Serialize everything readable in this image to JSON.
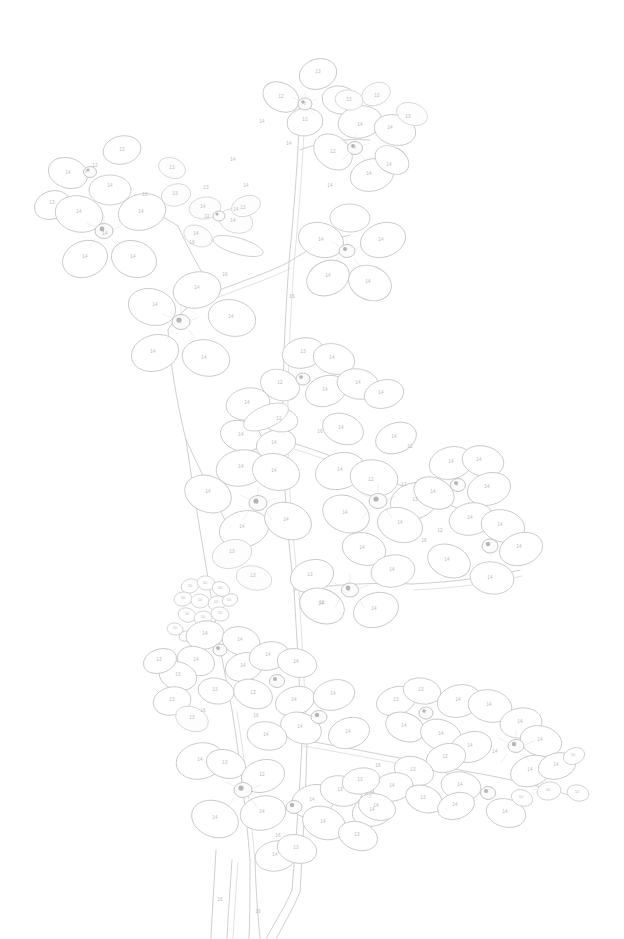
{
  "page": {
    "kind": "paint-by-numbers-coloring-page",
    "width": 624,
    "height": 939,
    "background_color": "#ffffff",
    "line_color": "#c9c9c9",
    "number_color": "#b9b9b9"
  },
  "palette_keys": {
    "petal": "14",
    "petal_alt": "13",
    "petal_shadow": "12",
    "bud": "10",
    "center": "2",
    "stem": "16"
  },
  "legend": [
    {
      "number": "2",
      "meaning": "flower center"
    },
    {
      "number": "10",
      "meaning": "small bud"
    },
    {
      "number": "12",
      "meaning": "shadowed petal"
    },
    {
      "number": "13",
      "meaning": "mid petal"
    },
    {
      "number": "14",
      "meaning": "light petal"
    },
    {
      "number": "16",
      "meaning": "stem"
    }
  ],
  "regions": [
    {
      "n": "13",
      "x": 318,
      "y": 72
    },
    {
      "n": "12",
      "x": 281,
      "y": 97
    },
    {
      "n": "13",
      "x": 305,
      "y": 120
    },
    {
      "n": "13",
      "x": 349,
      "y": 100
    },
    {
      "n": "12",
      "x": 377,
      "y": 96
    },
    {
      "n": "2",
      "x": 305,
      "y": 104
    },
    {
      "n": "14",
      "x": 262,
      "y": 122
    },
    {
      "n": "14",
      "x": 289,
      "y": 144
    },
    {
      "n": "14",
      "x": 233,
      "y": 160
    },
    {
      "n": "14",
      "x": 360,
      "y": 125
    },
    {
      "n": "14",
      "x": 390,
      "y": 128
    },
    {
      "n": "13",
      "x": 408,
      "y": 117
    },
    {
      "n": "12",
      "x": 333,
      "y": 152
    },
    {
      "n": "14",
      "x": 369,
      "y": 174
    },
    {
      "n": "14",
      "x": 389,
      "y": 165
    },
    {
      "n": "2",
      "x": 355,
      "y": 148
    },
    {
      "n": "14",
      "x": 330,
      "y": 186
    },
    {
      "n": "14",
      "x": 246,
      "y": 186
    },
    {
      "n": "13",
      "x": 206,
      "y": 188
    },
    {
      "n": "14",
      "x": 236,
      "y": 210
    },
    {
      "n": "13",
      "x": 122,
      "y": 150
    },
    {
      "n": "14",
      "x": 68,
      "y": 173
    },
    {
      "n": "13",
      "x": 52,
      "y": 203
    },
    {
      "n": "14",
      "x": 110,
      "y": 186
    },
    {
      "n": "12",
      "x": 95,
      "y": 166
    },
    {
      "n": "2",
      "x": 86,
      "y": 172
    },
    {
      "n": "13",
      "x": 172,
      "y": 168
    },
    {
      "n": "13",
      "x": 175,
      "y": 194
    },
    {
      "n": "14",
      "x": 79,
      "y": 212
    },
    {
      "n": "14",
      "x": 105,
      "y": 234
    },
    {
      "n": "14",
      "x": 141,
      "y": 212
    },
    {
      "n": "2",
      "x": 103,
      "y": 230
    },
    {
      "n": "14",
      "x": 85,
      "y": 257
    },
    {
      "n": "14",
      "x": 133,
      "y": 257
    },
    {
      "n": "13",
      "x": 145,
      "y": 195
    },
    {
      "n": "14",
      "x": 203,
      "y": 207
    },
    {
      "n": "12",
      "x": 207,
      "y": 217
    },
    {
      "n": "14",
      "x": 233,
      "y": 221
    },
    {
      "n": "13",
      "x": 243,
      "y": 208
    },
    {
      "n": "14",
      "x": 196,
      "y": 234
    },
    {
      "n": "16",
      "x": 192,
      "y": 243
    },
    {
      "n": "14",
      "x": 197,
      "y": 288
    },
    {
      "n": "14",
      "x": 155,
      "y": 305
    },
    {
      "n": "14",
      "x": 231,
      "y": 317
    },
    {
      "n": "2",
      "x": 180,
      "y": 322
    },
    {
      "n": "14",
      "x": 153,
      "y": 352
    },
    {
      "n": "14",
      "x": 204,
      "y": 358
    },
    {
      "n": "16",
      "x": 225,
      "y": 275
    },
    {
      "n": "16",
      "x": 292,
      "y": 297
    },
    {
      "n": "14",
      "x": 321,
      "y": 240
    },
    {
      "n": "14",
      "x": 381,
      "y": 240
    },
    {
      "n": "2",
      "x": 346,
      "y": 250
    },
    {
      "n": "14",
      "x": 328,
      "y": 276
    },
    {
      "n": "14",
      "x": 368,
      "y": 282
    },
    {
      "n": "13",
      "x": 303,
      "y": 352
    },
    {
      "n": "14",
      "x": 332,
      "y": 358
    },
    {
      "n": "12",
      "x": 280,
      "y": 383
    },
    {
      "n": "14",
      "x": 247,
      "y": 403
    },
    {
      "n": "14",
      "x": 325,
      "y": 390
    },
    {
      "n": "2",
      "x": 302,
      "y": 378
    },
    {
      "n": "14",
      "x": 358,
      "y": 383
    },
    {
      "n": "14",
      "x": 381,
      "y": 393
    },
    {
      "n": "12",
      "x": 279,
      "y": 419
    },
    {
      "n": "14",
      "x": 241,
      "y": 435
    },
    {
      "n": "14",
      "x": 274,
      "y": 443
    },
    {
      "n": "16",
      "x": 320,
      "y": 432
    },
    {
      "n": "14",
      "x": 341,
      "y": 428
    },
    {
      "n": "14",
      "x": 394,
      "y": 437
    },
    {
      "n": "12",
      "x": 410,
      "y": 447
    },
    {
      "n": "14",
      "x": 451,
      "y": 462
    },
    {
      "n": "14",
      "x": 479,
      "y": 460
    },
    {
      "n": "2",
      "x": 457,
      "y": 485
    },
    {
      "n": "14",
      "x": 433,
      "y": 492
    },
    {
      "n": "13",
      "x": 404,
      "y": 485
    },
    {
      "n": "14",
      "x": 487,
      "y": 487
    },
    {
      "n": "14",
      "x": 241,
      "y": 467
    },
    {
      "n": "14",
      "x": 274,
      "y": 471
    },
    {
      "n": "14",
      "x": 208,
      "y": 492
    },
    {
      "n": "2",
      "x": 257,
      "y": 503
    },
    {
      "n": "14",
      "x": 242,
      "y": 527
    },
    {
      "n": "14",
      "x": 286,
      "y": 520
    },
    {
      "n": "13",
      "x": 232,
      "y": 552
    },
    {
      "n": "14",
      "x": 340,
      "y": 470
    },
    {
      "n": "12",
      "x": 371,
      "y": 480
    },
    {
      "n": "2",
      "x": 377,
      "y": 500
    },
    {
      "n": "14",
      "x": 345,
      "y": 513
    },
    {
      "n": "13",
      "x": 415,
      "y": 500
    },
    {
      "n": "14",
      "x": 400,
      "y": 523
    },
    {
      "n": "14",
      "x": 470,
      "y": 518
    },
    {
      "n": "12",
      "x": 440,
      "y": 531
    },
    {
      "n": "14",
      "x": 500,
      "y": 525
    },
    {
      "n": "2",
      "x": 489,
      "y": 545
    },
    {
      "n": "14",
      "x": 519,
      "y": 547
    },
    {
      "n": "14",
      "x": 447,
      "y": 560
    },
    {
      "n": "16",
      "x": 424,
      "y": 541
    },
    {
      "n": "14",
      "x": 362,
      "y": 548
    },
    {
      "n": "13",
      "x": 310,
      "y": 575
    },
    {
      "n": "14",
      "x": 392,
      "y": 570
    },
    {
      "n": "2",
      "x": 349,
      "y": 590
    },
    {
      "n": "14",
      "x": 321,
      "y": 604
    },
    {
      "n": "14",
      "x": 374,
      "y": 609
    },
    {
      "n": "13",
      "x": 253,
      "y": 576
    },
    {
      "n": "16",
      "x": 322,
      "y": 603
    },
    {
      "n": "14",
      "x": 490,
      "y": 578
    },
    {
      "n": "10",
      "x": 190,
      "y": 586
    },
    {
      "n": "10",
      "x": 205,
      "y": 583
    },
    {
      "n": "10",
      "x": 220,
      "y": 588
    },
    {
      "n": "10",
      "x": 183,
      "y": 598
    },
    {
      "n": "10",
      "x": 200,
      "y": 600
    },
    {
      "n": "10",
      "x": 216,
      "y": 602
    },
    {
      "n": "10",
      "x": 187,
      "y": 614
    },
    {
      "n": "10",
      "x": 203,
      "y": 617
    },
    {
      "n": "10",
      "x": 220,
      "y": 613
    },
    {
      "n": "10",
      "x": 229,
      "y": 600
    },
    {
      "n": "14",
      "x": 205,
      "y": 634
    },
    {
      "n": "10",
      "x": 175,
      "y": 628
    },
    {
      "n": "14",
      "x": 240,
      "y": 640
    },
    {
      "n": "2",
      "x": 219,
      "y": 649
    },
    {
      "n": "14",
      "x": 196,
      "y": 660
    },
    {
      "n": "14",
      "x": 243,
      "y": 666
    },
    {
      "n": "13",
      "x": 178,
      "y": 675
    },
    {
      "n": "13",
      "x": 159,
      "y": 660
    },
    {
      "n": "13",
      "x": 172,
      "y": 700
    },
    {
      "n": "13",
      "x": 215,
      "y": 690
    },
    {
      "n": "16",
      "x": 203,
      "y": 711
    },
    {
      "n": "13",
      "x": 192,
      "y": 718
    },
    {
      "n": "14",
      "x": 268,
      "y": 655
    },
    {
      "n": "14",
      "x": 296,
      "y": 662
    },
    {
      "n": "2",
      "x": 276,
      "y": 680
    },
    {
      "n": "13",
      "x": 253,
      "y": 693
    },
    {
      "n": "14",
      "x": 294,
      "y": 700
    },
    {
      "n": "16",
      "x": 256,
      "y": 716
    },
    {
      "n": "14",
      "x": 333,
      "y": 694
    },
    {
      "n": "2",
      "x": 318,
      "y": 716
    },
    {
      "n": "14",
      "x": 300,
      "y": 727
    },
    {
      "n": "14",
      "x": 348,
      "y": 732
    },
    {
      "n": "14",
      "x": 266,
      "y": 735
    },
    {
      "n": "14",
      "x": 200,
      "y": 760
    },
    {
      "n": "2",
      "x": 242,
      "y": 790
    },
    {
      "n": "13",
      "x": 225,
      "y": 763
    },
    {
      "n": "12",
      "x": 262,
      "y": 775
    },
    {
      "n": "14",
      "x": 215,
      "y": 818
    },
    {
      "n": "14",
      "x": 262,
      "y": 812
    },
    {
      "n": "16",
      "x": 278,
      "y": 836
    },
    {
      "n": "14",
      "x": 275,
      "y": 855
    },
    {
      "n": "13",
      "x": 296,
      "y": 848
    },
    {
      "n": "14",
      "x": 312,
      "y": 800
    },
    {
      "n": "2",
      "x": 293,
      "y": 806
    },
    {
      "n": "13",
      "x": 340,
      "y": 790
    },
    {
      "n": "14",
      "x": 323,
      "y": 822
    },
    {
      "n": "14",
      "x": 372,
      "y": 810
    },
    {
      "n": "2",
      "x": 370,
      "y": 797
    },
    {
      "n": "13",
      "x": 357,
      "y": 835
    },
    {
      "n": "16",
      "x": 220,
      "y": 900
    },
    {
      "n": "16",
      "x": 258,
      "y": 912
    },
    {
      "n": "13",
      "x": 396,
      "y": 700
    },
    {
      "n": "13",
      "x": 421,
      "y": 690
    },
    {
      "n": "2",
      "x": 425,
      "y": 712
    },
    {
      "n": "14",
      "x": 404,
      "y": 726
    },
    {
      "n": "14",
      "x": 458,
      "y": 700
    },
    {
      "n": "14",
      "x": 489,
      "y": 705
    },
    {
      "n": "14",
      "x": 441,
      "y": 734
    },
    {
      "n": "14",
      "x": 470,
      "y": 746
    },
    {
      "n": "2",
      "x": 515,
      "y": 745
    },
    {
      "n": "14",
      "x": 495,
      "y": 752
    },
    {
      "n": "14",
      "x": 540,
      "y": 740
    },
    {
      "n": "10",
      "x": 573,
      "y": 755
    },
    {
      "n": "14",
      "x": 530,
      "y": 770
    },
    {
      "n": "12",
      "x": 445,
      "y": 757
    },
    {
      "n": "13",
      "x": 413,
      "y": 770
    },
    {
      "n": "14",
      "x": 392,
      "y": 786
    },
    {
      "n": "14",
      "x": 460,
      "y": 785
    },
    {
      "n": "2",
      "x": 487,
      "y": 792
    },
    {
      "n": "13",
      "x": 423,
      "y": 798
    },
    {
      "n": "14",
      "x": 455,
      "y": 805
    },
    {
      "n": "10",
      "x": 521,
      "y": 797
    },
    {
      "n": "10",
      "x": 548,
      "y": 790
    },
    {
      "n": "10",
      "x": 577,
      "y": 792
    },
    {
      "n": "14",
      "x": 505,
      "y": 812
    },
    {
      "n": "13",
      "x": 360,
      "y": 780
    },
    {
      "n": "14",
      "x": 376,
      "y": 806
    },
    {
      "n": "16",
      "x": 378,
      "y": 766
    },
    {
      "n": "14",
      "x": 520,
      "y": 722
    },
    {
      "n": "14",
      "x": 556,
      "y": 765
    }
  ]
}
